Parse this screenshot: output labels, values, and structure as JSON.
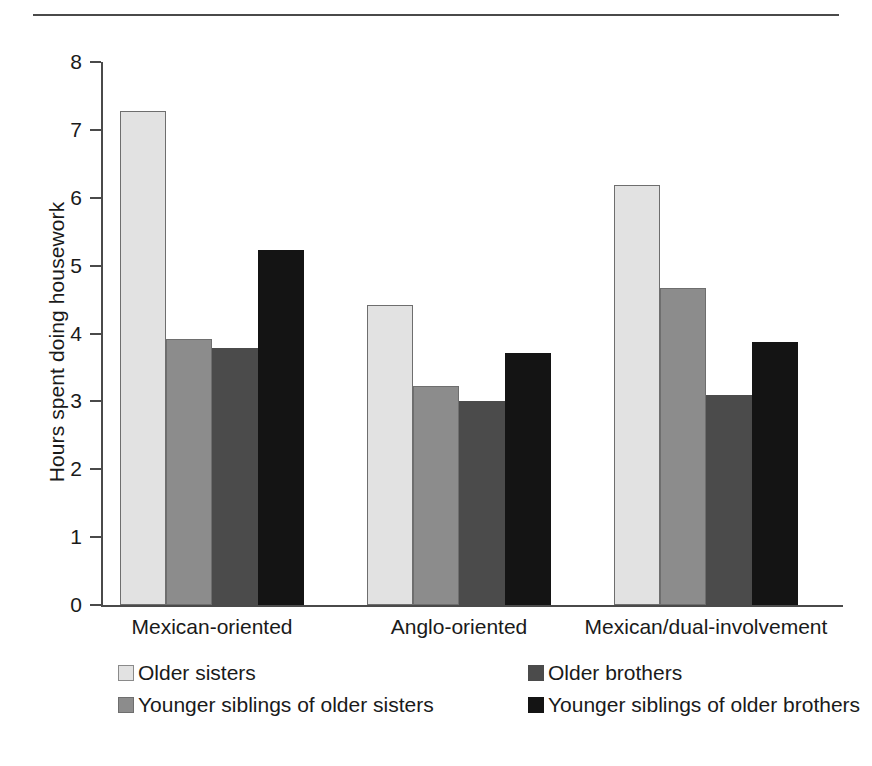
{
  "chart_data": {
    "type": "bar",
    "title": "",
    "subtitle": "",
    "xlabel": "",
    "ylabel": "Hours spent doing housework",
    "ylim": [
      0,
      8
    ],
    "ytick_labels": [
      "8",
      "7",
      "6",
      "5",
      "4",
      "3",
      "2",
      "1",
      "0"
    ],
    "ytick_values": [
      8,
      7,
      6,
      5,
      4,
      3,
      2,
      1,
      0
    ],
    "grid": false,
    "legend_position": "bottom",
    "categories": [
      "Mexican-oriented",
      "Anglo-oriented",
      "Mexican/dual-involvement"
    ],
    "series": [
      {
        "name": "Older sisters",
        "color": "#e2e2e2",
        "values": [
          7.28,
          4.42,
          6.19
        ]
      },
      {
        "name": "Younger siblings of older sisters",
        "color": "#8c8c8c",
        "values": [
          3.92,
          3.22,
          4.67
        ]
      },
      {
        "name": "Older brothers",
        "color": "#4b4b4b",
        "values": [
          3.78,
          3.01,
          3.09
        ]
      },
      {
        "name": "Younger siblings of older brothers",
        "color": "#141414",
        "values": [
          5.23,
          3.71,
          3.88
        ]
      }
    ],
    "legend_layout": [
      {
        "row": 0,
        "col": 0,
        "series_index": 0
      },
      {
        "row": 0,
        "col": 1,
        "series_index": 2
      },
      {
        "row": 1,
        "col": 0,
        "series_index": 1
      },
      {
        "row": 1,
        "col": 1,
        "series_index": 3
      }
    ]
  },
  "figure": {
    "axis_color": "#4a4a4a",
    "text_color": "#1a1a1a",
    "background": "#ffffff",
    "has_top_rule": true
  }
}
